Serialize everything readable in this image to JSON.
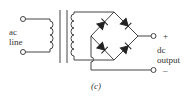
{
  "diagram": {
    "type": "full-wave bridge rectifier with transformer",
    "labels": {
      "input_line1": "ac",
      "input_line2": "line",
      "output_line1": "dc",
      "output_line2": "output",
      "plus": "+",
      "minus": "–",
      "caption": "(c)"
    },
    "colors": {
      "stroke": "#444444",
      "background": "#ffffff"
    },
    "components": [
      "ac input terminals",
      "transformer primary coil",
      "iron core",
      "transformer secondary coil",
      "diode bridge (4 diodes)",
      "dc output terminals"
    ]
  }
}
